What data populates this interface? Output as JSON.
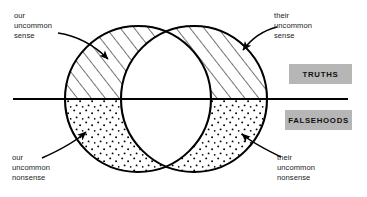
{
  "diagram": {
    "annotations": [
      {
        "id": "our-uncommon-sense",
        "lines": [
          "our",
          "uncommon",
          "sense"
        ],
        "points_to": "left-circle-upper-crescent"
      },
      {
        "id": "their-uncommon-sense",
        "lines": [
          "their",
          "uncommon",
          "sense"
        ],
        "points_to": "right-circle-upper-crescent"
      },
      {
        "id": "our-uncommon-nonsense",
        "lines": [
          "our",
          "uncommon",
          "nonsense"
        ],
        "points_to": "left-circle-lower-crescent"
      },
      {
        "id": "their-uncommon-nonsense",
        "lines": [
          "their",
          "uncommon",
          "nonsense"
        ],
        "points_to": "right-circle-lower-crescent"
      }
    ],
    "legend": [
      {
        "id": "truths",
        "label": "TRUTHS",
        "swatch_color": "#b6b6b6",
        "region": "above-divider"
      },
      {
        "id": "falsehoods",
        "label": "FALSEHOODS",
        "swatch_color": "#b6b6b6",
        "region": "below-divider"
      }
    ],
    "colors": {
      "stroke": "#000000",
      "background": "#ffffff",
      "legend_fill": "#b6b6b6",
      "text": "#1b1b1b"
    },
    "shapes": {
      "left_circle": {
        "cx": 138,
        "cy": 99,
        "r": 73
      },
      "right_circle": {
        "cx": 194,
        "cy": 99,
        "r": 73
      },
      "divider_line": {
        "x1": 13,
        "y1": 99,
        "x2": 348,
        "y2": 99
      },
      "upper_fill": "diagonal-hatch",
      "lower_fill": "stipple-dots",
      "overlap_fill": "none"
    }
  }
}
